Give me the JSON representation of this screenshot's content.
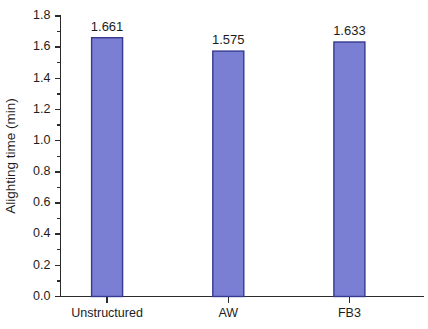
{
  "chart_data": {
    "type": "bar",
    "title": "",
    "subtitle": "",
    "categories": [
      "Unstructured",
      "AW",
      "FB3"
    ],
    "values": [
      1.661,
      1.575,
      1.633
    ],
    "data_labels": [
      "1.661",
      "1.575",
      "1.633"
    ],
    "series": [
      {
        "name": "Alighting time",
        "values": [
          1.661,
          1.575,
          1.633
        ]
      }
    ],
    "xlabel": "",
    "ylabel": "Alighting time (min)",
    "ylim": [
      0.0,
      1.8
    ],
    "xlim": [
      0,
      3
    ],
    "ytick_values": [
      0.0,
      0.2,
      0.4,
      0.6,
      0.8,
      1.0,
      1.2,
      1.4,
      1.6,
      1.8
    ],
    "ytick_labels": [
      "0.0",
      "0.2",
      "0.4",
      "0.6",
      "0.8",
      "1.0",
      "1.2",
      "1.4",
      "1.6",
      "1.8"
    ],
    "yminor_tick_values": [
      0.1,
      0.3,
      0.5,
      0.7,
      0.9,
      1.1,
      1.3,
      1.5,
      1.7
    ],
    "grid": false,
    "legend": false,
    "legend_position": "none",
    "bar_fill_color": "#7b7fd4",
    "bar_edge_color": "#353a8f",
    "axis_color": "#2b2b2b",
    "background_color": "#ffffff"
  },
  "axes": {
    "y_title": "Alighting time (min)"
  }
}
